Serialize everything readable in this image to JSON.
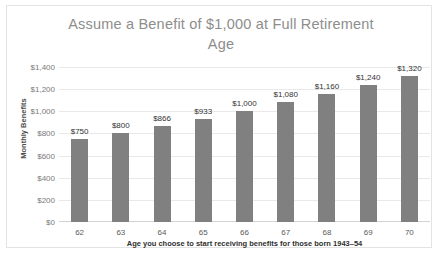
{
  "chart_data": {
    "type": "bar",
    "title": "Assume a Benefit of $1,000 at Full Retirement Age",
    "title_line1": "Assume a Benefit of $1,000 at Full Retirement",
    "title_line2": "Age",
    "xlabel": "Age you choose to start receiving benefits for those born 1943–54",
    "ylabel": "Monthly Benefits",
    "categories": [
      "62",
      "63",
      "64",
      "65",
      "66",
      "67",
      "68",
      "69",
      "70"
    ],
    "values": [
      750,
      800,
      866,
      933,
      1000,
      1080,
      1160,
      1240,
      1320
    ],
    "data_labels": [
      "$750",
      "$800",
      "$866",
      "$933",
      "$1,000",
      "$1,080",
      "$1,160",
      "$1,240",
      "$1,320"
    ],
    "ylim": [
      0,
      1400
    ],
    "ytick_values": [
      0,
      200,
      400,
      600,
      800,
      1000,
      1200,
      1400
    ],
    "ytick_labels": [
      "$0",
      "$200",
      "$400",
      "$600",
      "$800",
      "$1,000",
      "$1,200",
      "$1,400"
    ],
    "grid": true,
    "legend": "none",
    "bar_color": "#808080",
    "gridline_color": "#e9e9e9",
    "title_color": "#8d8d8d",
    "background_color": "#ffffff",
    "border_color": "#e3e3e3"
  }
}
